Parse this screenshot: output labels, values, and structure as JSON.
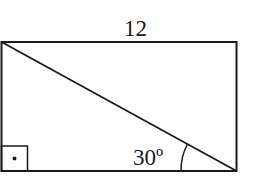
{
  "diagram": {
    "type": "rectangle-with-diagonal",
    "top_side_label": "12",
    "angle_label": "30º",
    "right_angle_marker": "square with dot",
    "colors": {
      "stroke": "#1a1a1a",
      "background": "#ffffff"
    }
  }
}
